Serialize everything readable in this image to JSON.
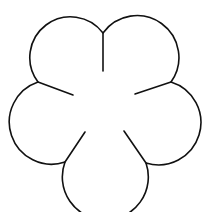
{
  "figure": {
    "width": 206,
    "height": 212,
    "background": "#ffffff",
    "stroke_color": "#111111",
    "petal_count": 5,
    "center": [
      104,
      110
    ],
    "petal_radius": 35,
    "cusps": [
      {
        "name": "top",
        "point": [
          103,
          33
        ]
      },
      {
        "name": "right",
        "point": [
          171,
          82
        ]
      },
      {
        "name": "lower-right",
        "point": [
          146,
          163
        ]
      },
      {
        "name": "lower-left",
        "point": [
          65,
          162
        ]
      },
      {
        "name": "left",
        "point": [
          38,
          82
        ]
      }
    ],
    "veins": [
      {
        "name": "top",
        "from": [
          103,
          33
        ],
        "to": [
          103,
          71
        ]
      },
      {
        "name": "right",
        "from": [
          171,
          82
        ],
        "to": [
          135,
          94
        ]
      },
      {
        "name": "lower-right",
        "from": [
          146,
          163
        ],
        "to": [
          124,
          131
        ]
      },
      {
        "name": "lower-left",
        "from": [
          65,
          162
        ],
        "to": [
          85,
          132
        ]
      },
      {
        "name": "left",
        "from": [
          38,
          82
        ],
        "to": [
          73,
          95
        ]
      }
    ]
  }
}
